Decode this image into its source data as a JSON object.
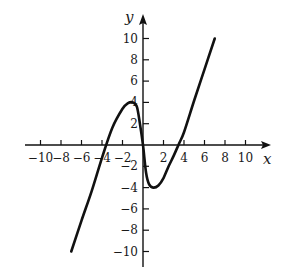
{
  "chart_data": {
    "type": "line",
    "title": "",
    "xlabel": "x",
    "ylabel": "y",
    "xlim": [
      -12,
      12
    ],
    "ylim": [
      -12,
      12
    ],
    "grid": false,
    "legend": null,
    "x_ticks": [
      -10,
      -8,
      -6,
      -4,
      -2,
      2,
      4,
      6,
      8,
      10
    ],
    "x_tick_labels": [
      "−10",
      "−8",
      "−6",
      "−4",
      "−2",
      "2",
      "4",
      "6",
      "8",
      "10"
    ],
    "y_ticks": [
      10,
      8,
      6,
      4,
      2,
      -2,
      -4,
      -6,
      -8,
      -10
    ],
    "y_tick_labels": [
      "10",
      "8",
      "6",
      "4",
      "2",
      "−2",
      "−4",
      "−6",
      "−8",
      "−10"
    ],
    "series": [
      {
        "name": "f(x)",
        "x": [
          -7,
          -6,
          -5,
          -4,
          -3,
          -2,
          -1.5,
          -1,
          -0.6,
          -0.3,
          0,
          0.3,
          0.6,
          1,
          1.5,
          2,
          2.5,
          3,
          3.5,
          4,
          5,
          6,
          7
        ],
        "y": [
          -10,
          -7.1,
          -4.3,
          -1.2,
          1.6,
          3.4,
          3.9,
          4.0,
          3.6,
          2.0,
          0,
          -2.6,
          -3.7,
          -4.0,
          -3.8,
          -3.1,
          -2.0,
          -1.0,
          0.1,
          1.2,
          4.2,
          7.1,
          10
        ]
      }
    ],
    "annotations": []
  }
}
